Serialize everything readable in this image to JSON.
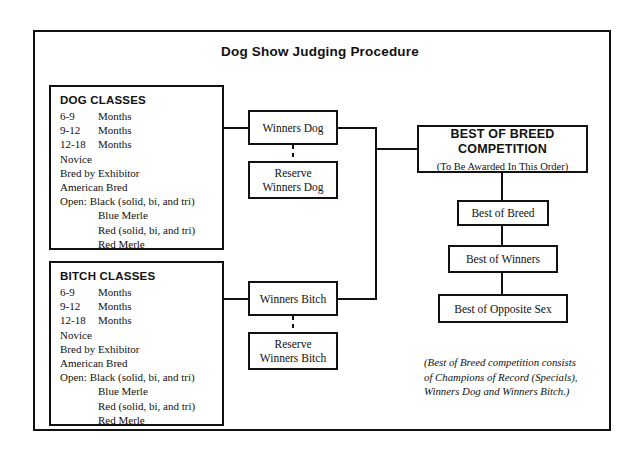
{
  "title": "Dog Show Judging Procedure",
  "dog_classes": {
    "header": "DOG CLASSES",
    "items": [
      {
        "age": "6-9",
        "label": "Months"
      },
      {
        "age": "9-12",
        "label": "Months"
      },
      {
        "age": "12-18",
        "label": "Months"
      },
      {
        "age": "",
        "label": "Novice"
      },
      {
        "age": "",
        "label": "Bred by Exhibitor"
      },
      {
        "age": "",
        "label": "American Bred"
      }
    ],
    "open_line": "Open: Black (solid, bi, and tri)",
    "open_sub": [
      "Blue Merle",
      "Red (solid, bi, and tri)",
      "Red Merle"
    ]
  },
  "bitch_classes": {
    "header": "BITCH CLASSES",
    "items": [
      {
        "age": "6-9",
        "label": "Months"
      },
      {
        "age": "9-12",
        "label": "Months"
      },
      {
        "age": "12-18",
        "label": "Months"
      },
      {
        "age": "",
        "label": "Novice"
      },
      {
        "age": "",
        "label": "Bred by Exhibitor"
      },
      {
        "age": "",
        "label": "American Bred"
      }
    ],
    "open_line": "Open: Black (solid, bi, and tri)",
    "open_sub": [
      "Blue Merle",
      "Red (solid, bi, and tri)",
      "Red Merle"
    ]
  },
  "nodes": {
    "winners_dog": "Winners Dog",
    "reserve_winners_dog_line1": "Reserve",
    "reserve_winners_dog_line2": "Winners Dog",
    "winners_bitch": "Winners Bitch",
    "reserve_winners_bitch_line1": "Reserve",
    "reserve_winners_bitch_line2": "Winners Bitch",
    "bob_title_line1": "BEST OF BREED",
    "bob_title_line2": "COMPETITION",
    "bob_subtitle": "(To Be Awarded In This Order)",
    "best_of_breed": "Best of Breed",
    "best_of_winners": "Best of Winners",
    "best_of_opposite_sex": "Best of Opposite Sex"
  },
  "footnote": "(Best of Breed competition consists\nof Champions of Record (Specials),\nWinners Dog and Winners Bitch.)",
  "colors": {
    "ink": "#111111",
    "paper": "#ffffff"
  }
}
